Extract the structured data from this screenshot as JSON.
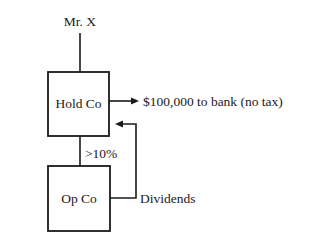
{
  "diagram": {
    "type": "ownership-structure",
    "nodes": {
      "owner": {
        "label": "Mr. X"
      },
      "holdco": {
        "label": "Hold Co"
      },
      "opco": {
        "label": "Op Co"
      }
    },
    "edges": {
      "ownership": {
        "label": ">10%"
      },
      "bank_flow": {
        "label": "$100,000 to bank (no tax)"
      },
      "dividends": {
        "label": "Dividends"
      }
    }
  }
}
